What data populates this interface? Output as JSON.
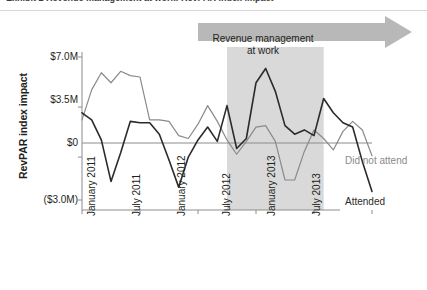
{
  "caption": {
    "text": "Exhibit 2  Revenue management at work: RevPAR index impact"
  },
  "chart_data": {
    "type": "line",
    "title": "",
    "xlabel": "",
    "ylabel": "RevPAR index impact",
    "ylim": [
      -3.0,
      7.0
    ],
    "ytick_values": [
      7.0,
      3.5,
      0,
      -3.0
    ],
    "ytick_labels": [
      "$7.0M",
      "$3.5M",
      "$0",
      "($3.0M)"
    ],
    "grid": false,
    "zero_line": true,
    "legend_position": "right-inline",
    "x": [
      "January 2011",
      "February 2011",
      "March 2011",
      "April 2011",
      "May 2011",
      "June 2011",
      "July 2011",
      "August 2011",
      "September 2011",
      "October 2011",
      "November 2011",
      "December 2011",
      "January 2012",
      "February 2012",
      "March 2012",
      "April 2012",
      "May 2012",
      "June 2012",
      "July 2012",
      "August 2012",
      "September 2012",
      "October 2012",
      "November 2012",
      "December 2012",
      "January 2013",
      "February 2013",
      "March 2013",
      "April 2013",
      "May 2013",
      "June 2013",
      "July 2013"
    ],
    "xtick_labels": [
      "January 2011",
      "July 2011",
      "January 2012",
      "July 2012",
      "January 2013",
      "July 2013"
    ],
    "xtick_indices": [
      0,
      6,
      12,
      18,
      24,
      30
    ],
    "series": [
      {
        "name": "Did not attend",
        "color": "#8a8a8a",
        "values": [
          2.6,
          4.7,
          5.9,
          5.2,
          6.0,
          5.7,
          5.6,
          2.6,
          2.6,
          2.5,
          1.5,
          1.3,
          2.3,
          3.6,
          2.5,
          1.2,
          0.2,
          1.1,
          2.1,
          2.2,
          1.1,
          -1.6,
          -1.6,
          0.4,
          1.9,
          1.3,
          0.5,
          1.8,
          2.5,
          1.9,
          0.1
        ]
      },
      {
        "name": "Attended",
        "color": "#2b2b2b",
        "values": [
          3.1,
          2.6,
          1.2,
          -1.7,
          0.3,
          2.5,
          2.4,
          2.4,
          1.6,
          -0.2,
          -2.1,
          0.0,
          1.2,
          2.1,
          1.1,
          3.6,
          0.6,
          1.3,
          5.2,
          6.2,
          4.6,
          2.2,
          1.6,
          1.9,
          1.5,
          4.1,
          3.1,
          2.4,
          2.1,
          -0.3,
          -2.4
        ]
      }
    ],
    "annotations": [
      {
        "name": "revenue-management-band",
        "type": "shaded-band",
        "label_line1": "Revenue management",
        "label_line2": "at work",
        "color": "#d2d2d2",
        "x_start": "April 2012",
        "x_end": "February 2013"
      }
    ]
  },
  "colors": {
    "attended": "#2b2b2b",
    "did_not_attend": "#8a8a8a",
    "band": "#d9d9d9",
    "arrow": "#b8b8b8",
    "axis": "#8c8c8c"
  }
}
